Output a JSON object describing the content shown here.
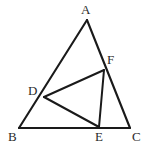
{
  "figure": {
    "background_color": "#ffffff",
    "line_color": "#1a1a1a",
    "label_color": "#2b2b2b",
    "canvas": {
      "width": 147,
      "height": 151
    },
    "points": {
      "A": {
        "label": "A",
        "x": 87,
        "y": 20,
        "label_x": 81,
        "label_y": 3
      },
      "B": {
        "label": "B",
        "x": 19,
        "y": 128,
        "label_x": 8,
        "label_y": 130
      },
      "C": {
        "label": "C",
        "x": 130,
        "y": 128,
        "label_x": 132,
        "label_y": 130
      },
      "D": {
        "label": "D",
        "x": 44,
        "y": 97,
        "label_x": 28,
        "label_y": 84
      },
      "E": {
        "label": "E",
        "x": 99,
        "y": 127,
        "label_x": 95,
        "label_y": 130
      },
      "F": {
        "label": "F",
        "x": 104,
        "y": 70,
        "label_x": 107,
        "label_y": 53
      }
    },
    "segments": [
      {
        "name": "side-AB",
        "from": "A",
        "to": "B",
        "kind": "edge"
      },
      {
        "name": "side-BC",
        "from": "B",
        "to": "C",
        "kind": "edge"
      },
      {
        "name": "side-CA",
        "from": "C",
        "to": "A",
        "kind": "edge"
      },
      {
        "name": "segment-DF",
        "from": "D",
        "to": "F",
        "kind": "cevian"
      },
      {
        "name": "segment-DE",
        "from": "D",
        "to": "E",
        "kind": "cevian"
      },
      {
        "name": "segment-FE",
        "from": "F",
        "to": "E",
        "kind": "cevian"
      }
    ]
  }
}
